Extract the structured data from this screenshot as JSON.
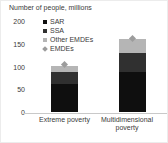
{
  "title": "Number of people, millions",
  "chart_data": {
    "type": "bar",
    "subtype": "stacked-bar-with-point-marker",
    "title": "Number of people, millions",
    "categories": [
      "Extreme poverty",
      "Multidimensional poverty"
    ],
    "series": [
      {
        "name": "SAR",
        "role": "stack",
        "marker": "square",
        "color": "#0f0f0f",
        "values": [
          63,
          90
        ]
      },
      {
        "name": "SSA",
        "role": "stack",
        "marker": "square",
        "color": "#303030",
        "values": [
          27,
          40
        ]
      },
      {
        "name": "Other EMDEs",
        "role": "stack",
        "marker": "square",
        "color": "#b5b5b5",
        "values": [
          13,
          31
        ]
      },
      {
        "name": "EMDEs",
        "role": "point",
        "marker": "diamond",
        "color": "#9c9c9c",
        "values": [
          103,
          161
        ]
      }
    ],
    "totals": [
      103,
      161
    ],
    "xlabel": "",
    "ylabel": "Number of people, millions",
    "ylim": [
      0,
      200
    ],
    "yticks": [
      0,
      50,
      100,
      150,
      200
    ],
    "grid": false,
    "legend_position": "upper-left-inside"
  },
  "colors": {
    "text": "#3a3a3a",
    "axis_line": "#c9c9c9",
    "background": "#ffffff"
  }
}
